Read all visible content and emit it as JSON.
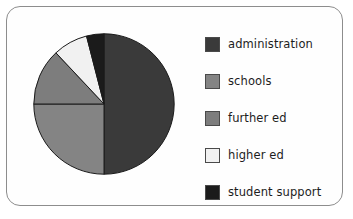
{
  "chart_data": {
    "type": "pie",
    "title": "",
    "labels": [
      "administration",
      "schools",
      "further ed",
      "higher ed",
      "student support"
    ],
    "values": [
      50,
      25,
      13,
      8,
      4
    ],
    "colors": [
      "#3a3a3a",
      "#848484",
      "#7d7d7d",
      "#f1f1f1",
      "#1b1b1b"
    ],
    "start_angle": 0,
    "direction": "clockwise",
    "legend_position": "right",
    "grid": false
  },
  "legend": {
    "items": [
      {
        "label": "administration",
        "color": "#3a3a3a"
      },
      {
        "label": "schools",
        "color": "#848484"
      },
      {
        "label": "further ed",
        "color": "#7d7d7d"
      },
      {
        "label": "higher ed",
        "color": "#f1f1f1"
      },
      {
        "label": "student support",
        "color": "#1b1b1b"
      }
    ]
  },
  "style": {
    "slice_edge_color": "#1a1a1a",
    "frame_color": "#8d8d8d",
    "background": "#ffffff"
  }
}
